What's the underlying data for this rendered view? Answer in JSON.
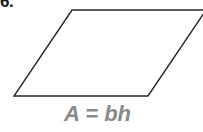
{
  "figure": {
    "problem_number": "6.",
    "formula": "A = bh",
    "formula_color": "#8a8a8a",
    "number_color": "#1a1a1a",
    "background_color": "#ffffff",
    "shape": {
      "name": "parallelogram",
      "stroke_color": "#262626",
      "stroke_width": 1.4,
      "fill_color": "none",
      "points": "72,10 206,10 148,96 14,96",
      "vertices": [
        {
          "label": "top-left",
          "x": 72,
          "y": 10
        },
        {
          "label": "top-right",
          "x": 206,
          "y": 10
        },
        {
          "label": "bottom-right",
          "x": 148,
          "y": 96
        },
        {
          "label": "bottom-left",
          "x": 14,
          "y": 96
        }
      ]
    }
  }
}
